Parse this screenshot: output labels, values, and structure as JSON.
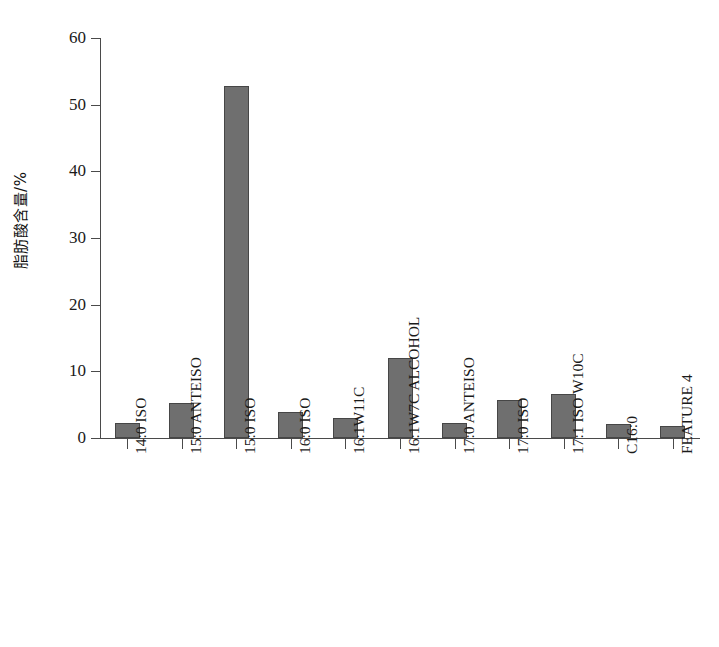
{
  "chart_data": {
    "type": "bar",
    "title": "",
    "subtitle": "",
    "xlabel": "",
    "ylabel": "脂肪酸含量/%",
    "ylim": [
      0,
      60
    ],
    "ytick_labels": [
      "0",
      "10",
      "20",
      "30",
      "40",
      "50",
      "60"
    ],
    "ytick_values": [
      0,
      10,
      20,
      30,
      40,
      50,
      60
    ],
    "grid": false,
    "legend": false,
    "legend_position": "none",
    "bar_color": "#6f6f6f",
    "bar_edge_color": "#464646",
    "axis_color": "#4a4a4a",
    "categories": [
      "14:0 ISO",
      "15:0 ANTEISO",
      "15:0 ISO",
      "16:0 ISO",
      "16:1W11C",
      "16:1W7C ALCOHOL",
      "17:0 ANTEISO",
      "17:0 ISO",
      "17:1 ISO W10C",
      "C16:0",
      "FEATURE 4"
    ],
    "values": [
      2.3,
      5.3,
      52.8,
      3.9,
      3.0,
      12.0,
      2.2,
      5.7,
      6.6,
      2.1,
      1.8
    ]
  }
}
